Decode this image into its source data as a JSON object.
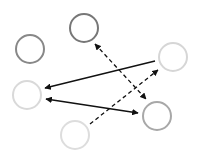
{
  "diagram": {
    "width": 200,
    "height": 161,
    "background": "#ffffff",
    "nodes": [
      {
        "id": "A",
        "name": "node-top-center",
        "cx": 84,
        "cy": 28,
        "r": 14,
        "stroke": "#777777"
      },
      {
        "id": "B",
        "name": "node-left-upper",
        "cx": 30,
        "cy": 49,
        "r": 14,
        "stroke": "#888888"
      },
      {
        "id": "C",
        "name": "node-right-upper",
        "cx": 173,
        "cy": 57,
        "r": 14,
        "stroke": "#d6d6d6"
      },
      {
        "id": "D",
        "name": "node-left-lower",
        "cx": 27,
        "cy": 95,
        "r": 14,
        "stroke": "#d9d9d9"
      },
      {
        "id": "E",
        "name": "node-right-lower",
        "cx": 157,
        "cy": 116,
        "r": 14,
        "stroke": "#a8a8a8"
      },
      {
        "id": "F",
        "name": "node-bottom",
        "cx": 75,
        "cy": 135,
        "r": 14,
        "stroke": "#dddddd"
      }
    ],
    "edges": [
      {
        "id": "C-D",
        "name": "edge-c-to-d",
        "x1": 155,
        "y1": 61,
        "x2": 45,
        "y2": 88,
        "style": "solid",
        "start_arrow": false,
        "end_arrow": true,
        "color": "#111111"
      },
      {
        "id": "D-E",
        "name": "edge-d-e",
        "x1": 46,
        "y1": 99,
        "x2": 138,
        "y2": 113,
        "style": "solid",
        "start_arrow": true,
        "end_arrow": true,
        "color": "#111111"
      },
      {
        "id": "A-E",
        "name": "edge-a-e",
        "x1": 95,
        "y1": 44,
        "x2": 146,
        "y2": 99,
        "style": "dashed",
        "start_arrow": true,
        "end_arrow": true,
        "color": "#111111"
      },
      {
        "id": "F-C",
        "name": "edge-f-to-c",
        "x1": 90,
        "y1": 124,
        "x2": 158,
        "y2": 70,
        "style": "dashed",
        "start_arrow": false,
        "end_arrow": true,
        "color": "#111111"
      }
    ]
  }
}
